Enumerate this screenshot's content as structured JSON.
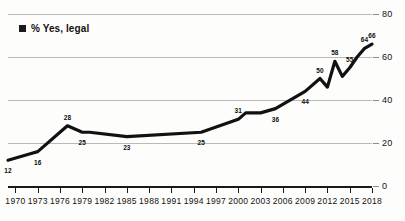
{
  "legend": {
    "swatch_name": "series-swatch",
    "label": "% Yes, legal"
  },
  "axis": {
    "y_ticks": [
      "0",
      "20",
      "40",
      "60",
      "80"
    ],
    "x_ticks": [
      "1970",
      "1973",
      "1976",
      "1979",
      "1982",
      "1985",
      "1988",
      "1991",
      "1994",
      "1997",
      "2000",
      "2003",
      "2006",
      "2009",
      "2012",
      "2015",
      "2018"
    ]
  },
  "chart_data": {
    "type": "line",
    "title": "",
    "subtitle": "",
    "xlabel": "",
    "ylabel": "",
    "xlim": [
      1969,
      2018
    ],
    "ylim": [
      0,
      80
    ],
    "grid": true,
    "legend_position": "top-left",
    "series": [
      {
        "name": "% Yes, legal",
        "color": "#111111",
        "x": [
          1969,
          1972,
          1973,
          1977,
          1979,
          1980,
          1985,
          1995,
          2000,
          2001,
          2003,
          2005,
          2009,
          2011,
          2012,
          2013,
          2014,
          2015,
          2016,
          2017,
          2018
        ],
        "values": [
          12,
          15,
          16,
          28,
          25,
          25,
          23,
          25,
          31,
          34,
          34,
          36,
          44,
          50,
          46,
          58,
          51,
          55,
          60,
          64,
          66
        ]
      }
    ],
    "point_labels": [
      {
        "x": 1969,
        "value": 12,
        "text": "12"
      },
      {
        "x": 1973,
        "value": 16,
        "text": "16"
      },
      {
        "x": 1977,
        "value": 28,
        "text": "28"
      },
      {
        "x": 1979,
        "value": 25,
        "text": "25"
      },
      {
        "x": 1985,
        "value": 23,
        "text": "23"
      },
      {
        "x": 1995,
        "value": 25,
        "text": "25"
      },
      {
        "x": 2000,
        "value": 31,
        "text": "31"
      },
      {
        "x": 2005,
        "value": 36,
        "text": "36"
      },
      {
        "x": 2009,
        "value": 44,
        "text": "44"
      },
      {
        "x": 2011,
        "value": 50,
        "text": "50"
      },
      {
        "x": 2013,
        "value": 58,
        "text": "58"
      },
      {
        "x": 2015,
        "value": 55,
        "text": "55"
      },
      {
        "x": 2017,
        "value": 64,
        "text": "64"
      },
      {
        "x": 2018,
        "value": 66,
        "text": "66"
      }
    ]
  }
}
